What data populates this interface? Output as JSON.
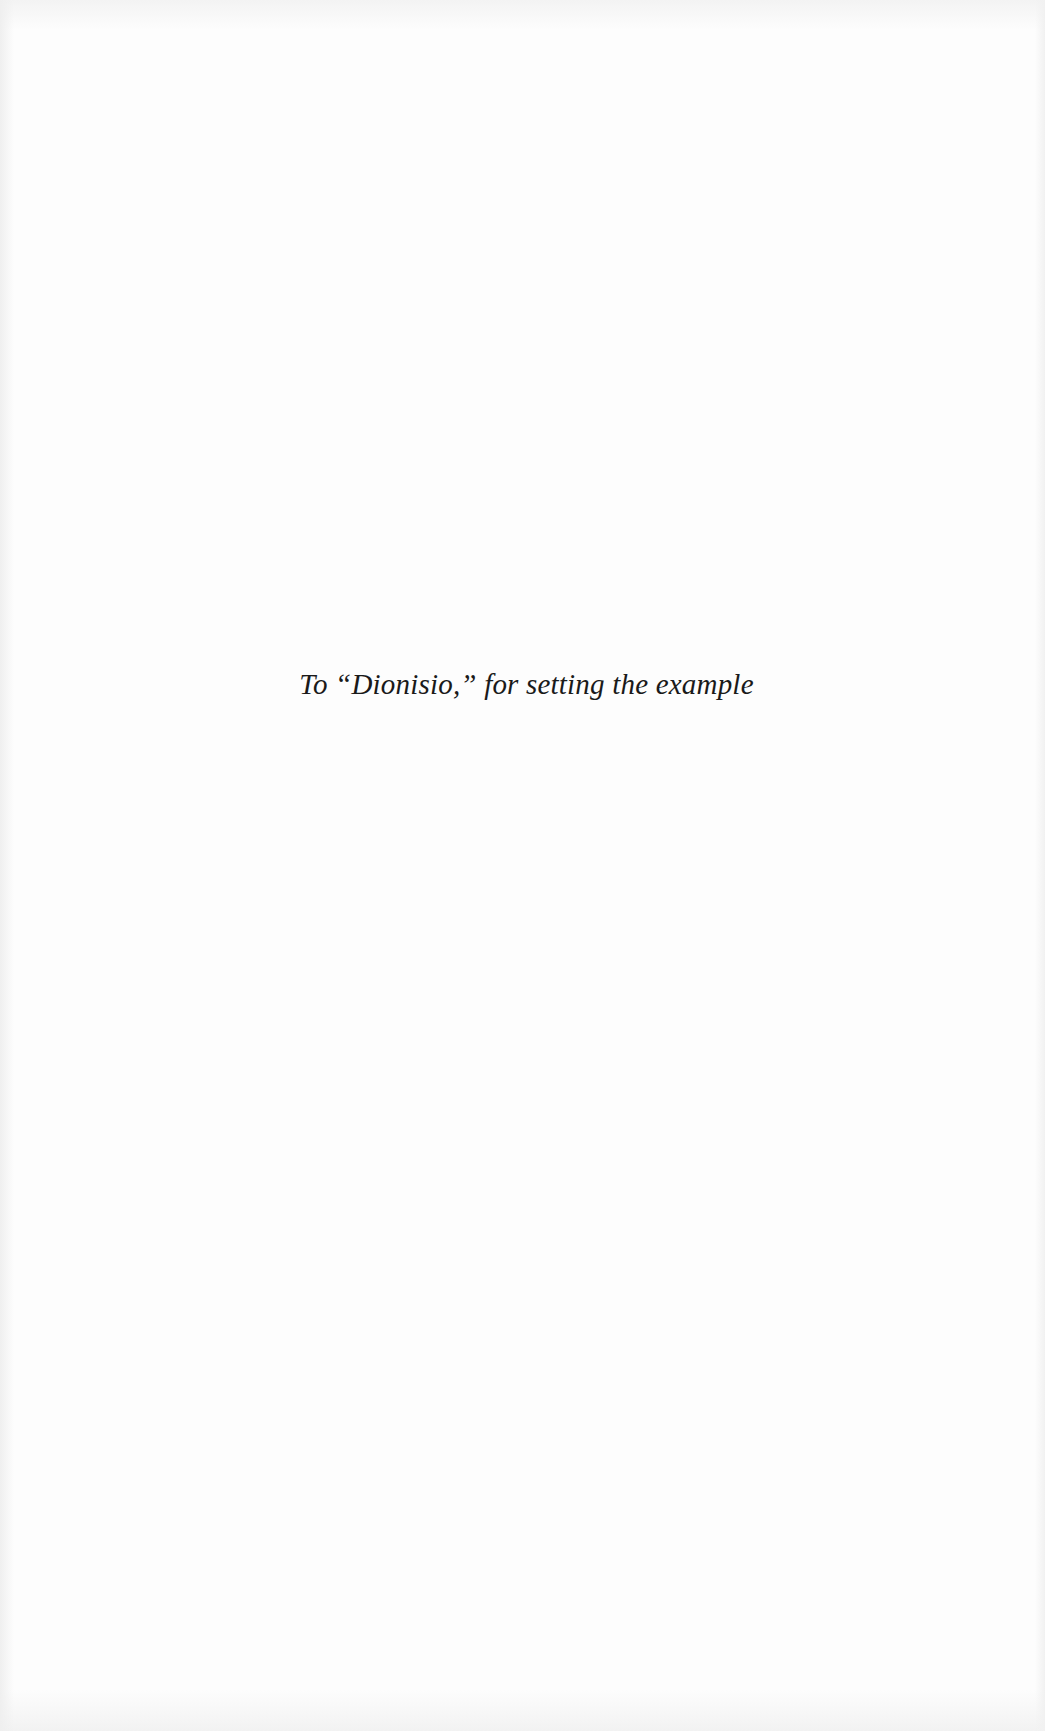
{
  "page": {
    "type": "dedication",
    "dedication_text": "To “Dionisio,” for setting the example"
  }
}
